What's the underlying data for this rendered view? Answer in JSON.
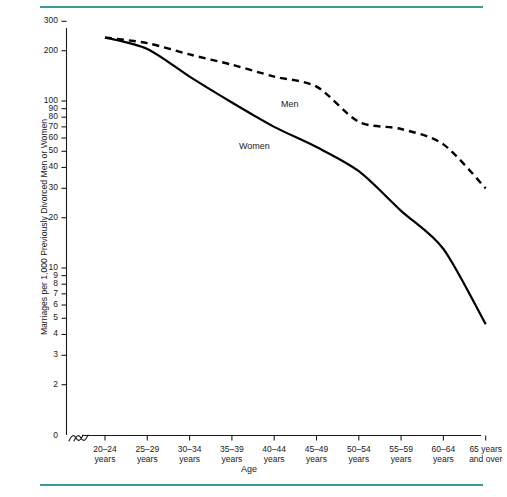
{
  "figure": {
    "rule_color": "#3a9a9a",
    "background": "#ffffff"
  },
  "chart_data": {
    "type": "line",
    "title": "",
    "subtitle": "",
    "xlabel": "Age",
    "ylabel": "Marriages per 1,000 Previously Divorced Men or Women",
    "yscale": "log",
    "ylim": [
      2,
      300
    ],
    "y_axis_break": true,
    "y_axis_break_symbol": "≈",
    "x_axis_break": true,
    "grid": false,
    "legend": "inline-labels",
    "yticks": [
      300,
      200,
      100,
      90,
      80,
      70,
      60,
      50,
      40,
      30,
      20,
      10,
      9,
      8,
      7,
      6,
      5,
      4,
      3,
      2,
      0
    ],
    "ytick_labels": [
      "300",
      "200",
      "100",
      "90",
      "80",
      "70",
      "60",
      "50",
      "40",
      "30",
      "20",
      "10",
      "9",
      "8",
      "7",
      "6",
      "5",
      "4",
      "3",
      "2",
      "0"
    ],
    "categories": [
      "20–24 years",
      "25–29 years",
      "30–34 years",
      "35–39 years",
      "40–44 years",
      "45–49 years",
      "50–54 years",
      "55–59 years",
      "60–64 years",
      "65 years and over"
    ],
    "xtick_labels_line1": [
      "20–24",
      "25–29",
      "30–34",
      "35–39",
      "40–44",
      "45–49",
      "50–54",
      "55–59",
      "60–64",
      "65 years"
    ],
    "xtick_labels_line2": [
      "years",
      "years",
      "years",
      "years",
      "years",
      "years",
      "years",
      "years",
      "years",
      "and over"
    ],
    "series": [
      {
        "name": "Men",
        "style": "dashed",
        "color": "#000000",
        "label_text": "Men",
        "values": [
          240,
          222,
          190,
          165,
          140,
          122,
          75,
          68,
          55,
          30
        ]
      },
      {
        "name": "Women",
        "style": "solid",
        "color": "#000000",
        "label_text": "Women",
        "values": [
          240,
          205,
          140,
          98,
          70,
          53,
          38,
          22,
          13,
          4.6
        ]
      }
    ]
  }
}
